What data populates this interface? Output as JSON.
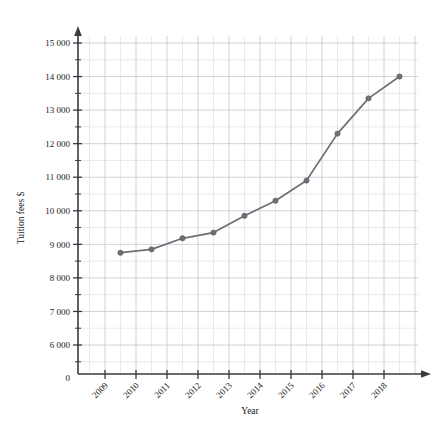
{
  "chart_data": {
    "type": "line",
    "title": "",
    "xlabel": "Year",
    "ylabel": "Tuition fees $",
    "categories": [
      "2009",
      "2010",
      "2011",
      "2012",
      "2013",
      "2014",
      "2015",
      "2016",
      "2017",
      "2018"
    ],
    "x": [
      2009.5,
      2010.5,
      2011.5,
      2012.5,
      2013.5,
      2014.5,
      2015.5,
      2016.5,
      2017.5,
      2018.5
    ],
    "values": [
      8750,
      8850,
      9180,
      9350,
      9850,
      10300,
      10900,
      12300,
      13350,
      14000
    ],
    "series": [
      {
        "name": "Tuition fees",
        "values": [
          8750,
          8850,
          9180,
          9350,
          9850,
          10300,
          10900,
          12300,
          13350,
          14000
        ]
      }
    ],
    "ylim": [
      0,
      15500
    ],
    "xlim": [
      2008.6,
      2019.4
    ],
    "y_major_ticks": [
      6000,
      7000,
      8000,
      9000,
      10000,
      11000,
      12000,
      13000,
      14000,
      15000
    ],
    "y_tick_labels": [
      "6 000",
      "7 000",
      "8 000",
      "9 000",
      "10 000",
      "11 000",
      "12 000",
      "13 000",
      "14 000",
      "15 000"
    ],
    "y_origin_label": "0",
    "y_minor_step": 500,
    "grid": true,
    "grid_style": "minor and major gridlines",
    "legend": "none",
    "legend_position": "none",
    "marker": "filled circle",
    "line_color": "#6e6e74",
    "marker_color": "#6e6e74",
    "grid_color": "#d9dde3",
    "axis_color": "#3a3a3a",
    "x_tick_rotation_deg": 45
  },
  "axes": {
    "y_title": "Tuition fees $",
    "x_title": "Year"
  }
}
